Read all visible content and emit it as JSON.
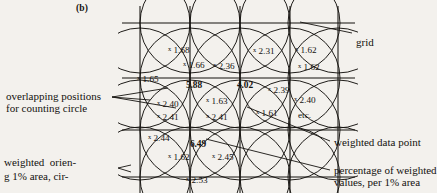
{
  "figure": {
    "panel_label": "(b)",
    "background_color": "#f3f1ed",
    "ink_color": "#14120f"
  },
  "grid": {
    "vertical_x": [
      140,
      190,
      240,
      290,
      338
    ],
    "horizontal_y": [
      23,
      78,
      130,
      177
    ],
    "circle_radius": 50
  },
  "annotations": {
    "grid_label": "grid",
    "overlapping_line1": "overlapping positions",
    "overlapping_line2": "for counting circle",
    "weighted_data_point": "weighted data point",
    "percentage_line1": "percentage of weighted",
    "percentage_line2": "values, per 1% area",
    "etc": "etc."
  },
  "column_text": {
    "line1": "weighted  orien-",
    "line2": "g 1% area, cir-"
  },
  "chart_data": {
    "type": "scatter",
    "title": "(b)",
    "xlabel": "",
    "ylabel": "",
    "marker": "x",
    "note": "Weighted data points (x N.NN) placed on a grid with overlapping counting circles; bold values are percentage of weighted values per 1% area at grid nodes.",
    "data_points": [
      {
        "label": "1.68",
        "value": 1.68,
        "x": 168,
        "y": 45,
        "bold": false
      },
      {
        "label": "1.66",
        "value": 1.66,
        "x": 183,
        "y": 60,
        "bold": false
      },
      {
        "label": "1.65",
        "value": 1.65,
        "x": 137,
        "y": 74,
        "bold": false
      },
      {
        "label": "2.36",
        "value": 2.36,
        "x": 213,
        "y": 61,
        "bold": false
      },
      {
        "label": "2.31",
        "value": 2.31,
        "x": 253,
        "y": 46,
        "bold": false
      },
      {
        "label": "1.62",
        "value": 1.62,
        "x": 295,
        "y": 45,
        "bold": false
      },
      {
        "label": "1.62",
        "value": 1.62,
        "x": 298,
        "y": 62,
        "bold": false
      },
      {
        "label": "5.88",
        "value": 5.88,
        "x": 186,
        "y": 80,
        "bold": true
      },
      {
        "label": "4.02",
        "value": 4.02,
        "x": 237,
        "y": 80,
        "bold": true
      },
      {
        "label": "2.39",
        "value": 2.39,
        "x": 268,
        "y": 85,
        "bold": false
      },
      {
        "label": "2.40",
        "value": 2.4,
        "x": 294,
        "y": 95,
        "bold": false
      },
      {
        "label": "2.40",
        "value": 2.4,
        "x": 157,
        "y": 99,
        "bold": false
      },
      {
        "label": "2.41",
        "value": 2.41,
        "x": 157,
        "y": 112,
        "bold": false
      },
      {
        "label": "1.63",
        "value": 1.63,
        "x": 206,
        "y": 96,
        "bold": false
      },
      {
        "label": "2.41",
        "value": 2.41,
        "x": 206,
        "y": 112,
        "bold": false
      },
      {
        "label": "1.61",
        "value": 1.61,
        "x": 256,
        "y": 108,
        "bold": false
      },
      {
        "label": "2.44",
        "value": 2.44,
        "x": 148,
        "y": 133,
        "bold": false
      },
      {
        "label": "6.49",
        "value": 6.49,
        "x": 190,
        "y": 139,
        "bold": true
      },
      {
        "label": "1.62",
        "value": 1.62,
        "x": 168,
        "y": 152,
        "bold": false
      },
      {
        "label": "2.45",
        "value": 2.45,
        "x": 212,
        "y": 152,
        "bold": false
      },
      {
        "label": "2.53",
        "value": 2.53,
        "x": 186,
        "y": 175,
        "bold": false
      }
    ],
    "bold_node_values": [
      5.88,
      4.02,
      6.49
    ],
    "legend": [
      {
        "name": "grid",
        "desc": "grid"
      },
      {
        "name": "weighted-data-point",
        "desc": "weighted data point"
      },
      {
        "name": "overlapping-positions",
        "desc": "overlapping positions for counting circle"
      },
      {
        "name": "percentage",
        "desc": "percentage of weighted values, per 1% area"
      }
    ]
  }
}
